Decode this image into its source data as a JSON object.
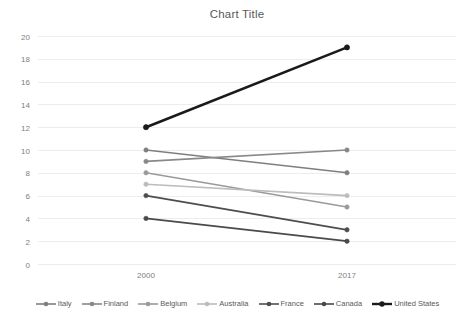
{
  "chart_data": {
    "type": "line",
    "title": "Chart Title",
    "xlabel": "",
    "ylabel": "",
    "categories": [
      "2000",
      "2017"
    ],
    "x_tick_labels": [
      "2000",
      "2017"
    ],
    "y_tick_labels": [
      "0",
      "2",
      "4",
      "6",
      "8",
      "10",
      "12",
      "14",
      "16",
      "18",
      "20"
    ],
    "y_ticks": [
      0,
      2,
      4,
      6,
      8,
      10,
      12,
      14,
      16,
      18,
      20
    ],
    "ylim": [
      0,
      20
    ],
    "grid": "horizontal",
    "legend_position": "bottom",
    "markers": "circle",
    "series": [
      {
        "name": "Italy",
        "values": [
          10,
          8
        ],
        "color": "#7f7f7f",
        "width": 1.6
      },
      {
        "name": "Finland",
        "values": [
          9,
          10
        ],
        "color": "#888888",
        "width": 1.6
      },
      {
        "name": "Belgium",
        "values": [
          8,
          5
        ],
        "color": "#9a9a9a",
        "width": 1.6
      },
      {
        "name": "Australia",
        "values": [
          7,
          6
        ],
        "color": "#bcbcbc",
        "width": 1.6
      },
      {
        "name": "France",
        "values": [
          6,
          3
        ],
        "color": "#4d4d4d",
        "width": 1.8
      },
      {
        "name": "Canada",
        "values": [
          4,
          2
        ],
        "color": "#4a4a4a",
        "width": 1.8
      },
      {
        "name": "United States",
        "values": [
          12,
          19
        ],
        "color": "#1a1a1a",
        "width": 2.6
      }
    ]
  },
  "legend": {
    "items": [
      {
        "label": "Italy"
      },
      {
        "label": "Finland"
      },
      {
        "label": "Belgium"
      },
      {
        "label": "Australia"
      },
      {
        "label": "France"
      },
      {
        "label": "Canada"
      },
      {
        "label": "United States"
      }
    ]
  },
  "colors": {
    "background": "#ffffff",
    "gridline": "#ededed",
    "tick_text": "#808080",
    "title_text": "#595959"
  }
}
